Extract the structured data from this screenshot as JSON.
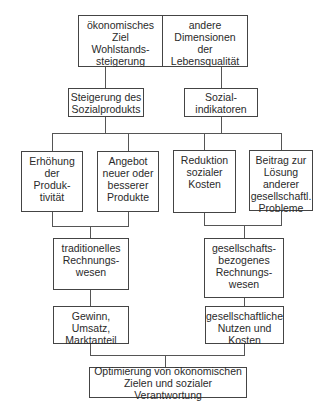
{
  "diagram": {
    "top": {
      "left": "ökonomisches\nZiel\nWohlstands-\nsteigerung",
      "right": "andere\nDimensionen\nder\nLebensqualität"
    },
    "level2": {
      "left": "Steigerung des\nSozialprodukts",
      "right": "Sozial-\nindikatoren"
    },
    "level3": [
      "Erhöhung\nder\nProduk-\ntivität",
      "Angebot\nneuer oder\nbesserer\nProdukte",
      "Reduktion\nsozialer\nKosten",
      "Beitrag zur\nLösung\nanderer\ngesellschaftl.\nProbleme"
    ],
    "level4": {
      "left": "traditionelles\nRechnungs-\nwesen",
      "right": "gesellschafts-\nbezogenes\nRechnungs-\nwesen"
    },
    "level5": {
      "left": "Gewinn,\nUmsatz,\nMarktanteil",
      "right": "gesellschaftliche\nNutzen und\nKosten"
    },
    "bottom": "Optimierung von ökonomischen\nZielen und sozialer Verantwortung"
  }
}
